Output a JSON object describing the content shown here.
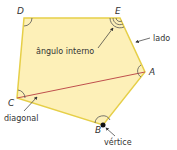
{
  "diagram": {
    "type": "pentagon",
    "colors": {
      "fill": "#fdf0b8",
      "stroke": "#e6cf48",
      "diagonal": "#c0504d",
      "arc": "#555555",
      "arrow": "#333333",
      "text": "#333333"
    },
    "vertices": {
      "A": {
        "label": "A",
        "x": 145,
        "y": 72
      },
      "B": {
        "label": "B",
        "x": 103,
        "y": 125
      },
      "C": {
        "label": "C",
        "x": 17,
        "y": 98
      },
      "D": {
        "label": "D",
        "x": 24,
        "y": 18
      },
      "E": {
        "label": "E",
        "x": 120,
        "y": 18
      }
    },
    "annotations": {
      "interior_angle": "ângulo interno",
      "side": "lado",
      "diagonal": "diagonal",
      "vertex": "vértice"
    }
  }
}
